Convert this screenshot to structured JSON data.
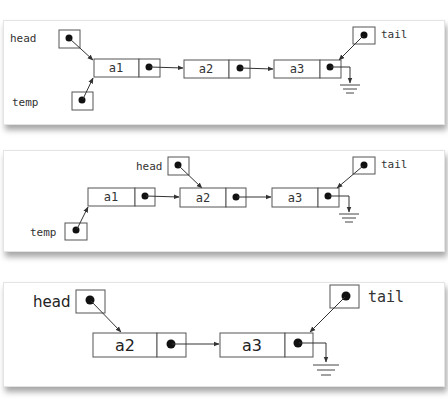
{
  "diagram": {
    "panels": [
      {
        "id": "step-1",
        "pointers": {
          "head": "head",
          "tail": "tail",
          "temp": "temp"
        },
        "nodes": [
          {
            "value": "a1"
          },
          {
            "value": "a2"
          },
          {
            "value": "a3"
          }
        ],
        "head_points_to": "a1",
        "temp_points_to": "a1",
        "tail_points_to": "a3",
        "last_next": "null (ground)"
      },
      {
        "id": "step-2",
        "pointers": {
          "head": "head",
          "tail": "tail",
          "temp": "temp"
        },
        "nodes": [
          {
            "value": "a1"
          },
          {
            "value": "a2"
          },
          {
            "value": "a3"
          }
        ],
        "head_points_to": "a2",
        "temp_points_to": "a1",
        "tail_points_to": "a3",
        "last_next": "null (ground)"
      },
      {
        "id": "step-3",
        "pointers": {
          "head": "head",
          "tail": "tail"
        },
        "nodes": [
          {
            "value": "a2"
          },
          {
            "value": "a3"
          }
        ],
        "head_points_to": "a2",
        "tail_points_to": "a3",
        "last_next": "null (ground)"
      }
    ]
  },
  "colors": {
    "line": "#333333",
    "box_border": "#555555",
    "shadow": "#999999"
  }
}
